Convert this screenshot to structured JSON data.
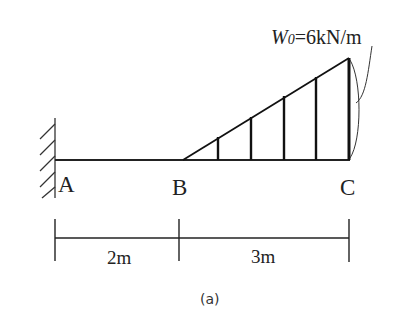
{
  "diagram": {
    "type": "cantilever beam with triangular distributed load",
    "points": {
      "A": "A",
      "B": "B",
      "C": "C"
    },
    "load": {
      "symbol": "W",
      "subscript": "0",
      "value_text": "=6kN/m",
      "shape": "linearly increasing from B to C"
    },
    "dimensions": [
      {
        "label": "2m",
        "from": "A",
        "to": "B"
      },
      {
        "label": "3m",
        "from": "B",
        "to": "C"
      }
    ],
    "support": "fixed wall at A",
    "caption": "(a)"
  }
}
